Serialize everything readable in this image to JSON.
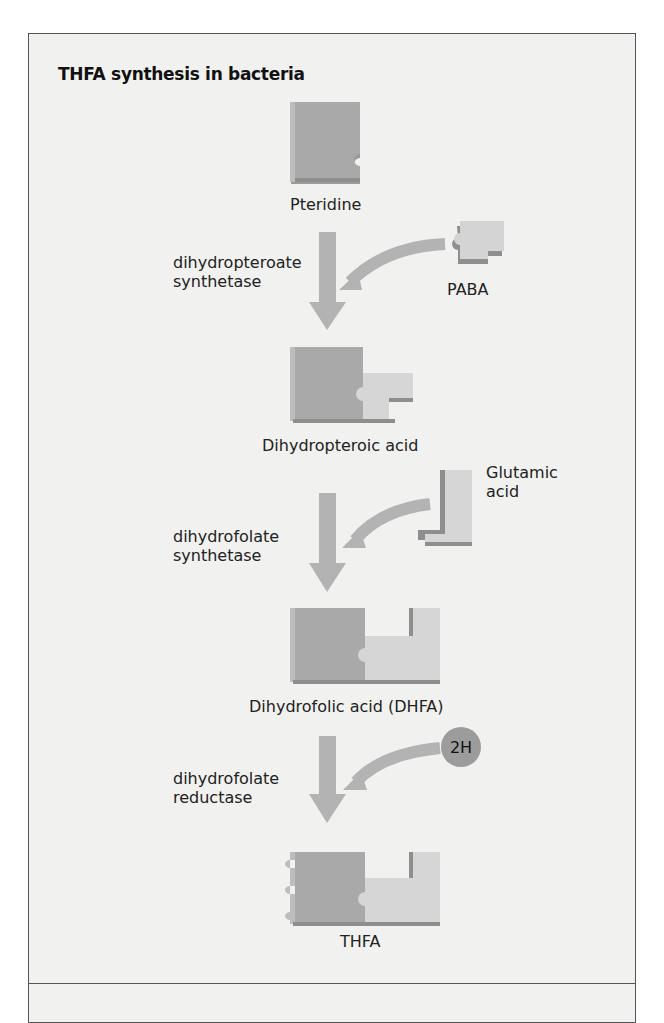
{
  "title": "THFA synthesis in bacteria",
  "colors": {
    "background": "#f1f1f0",
    "piece_dark": "#a9a9a9",
    "piece_light": "#d8d8d8",
    "arrow": "#b3b3b3",
    "hydrogen_circle": "#9c9c9c",
    "border": "#555555"
  },
  "molecules": {
    "pteridine": "Pteridine",
    "paba": "PABA",
    "dihydropteroic_acid": "Dihydropteroic acid",
    "glutamic_acid_line1": "Glutamic",
    "glutamic_acid_line2": "acid",
    "dhfa": "Dihydrofolic acid (DHFA)",
    "hydrogen": "2H",
    "thfa": "THFA"
  },
  "enzymes": [
    {
      "line1": "dihydropteroate",
      "line2": "synthetase"
    },
    {
      "line1": "dihydrofolate",
      "line2": "synthetase"
    },
    {
      "line1": "dihydrofolate",
      "line2": "reductase"
    }
  ],
  "steps": [
    {
      "substrate": "Pteridine",
      "enzyme": "dihydropteroate synthetase",
      "cofactor": "PABA",
      "product": "Dihydropteroic acid"
    },
    {
      "substrate": "Dihydropteroic acid",
      "enzyme": "dihydrofolate synthetase",
      "cofactor": "Glutamic acid",
      "product": "Dihydrofolic acid (DHFA)"
    },
    {
      "substrate": "Dihydrofolic acid (DHFA)",
      "enzyme": "dihydrofolate reductase",
      "cofactor": "2H",
      "product": "THFA"
    }
  ]
}
